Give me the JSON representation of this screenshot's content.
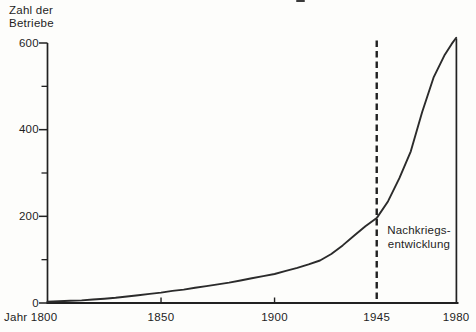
{
  "chart_data": {
    "type": "line",
    "title": "",
    "ylabel": "Zahl der Betriebe",
    "ylabel_lines": [
      "Zahl der",
      "Betriebe"
    ],
    "x_first_tick_label": "Jahr 1800",
    "xlim": [
      1800,
      1980
    ],
    "ylim": [
      0,
      600
    ],
    "grid": false,
    "legend": "none",
    "y_major_ticks": [
      0,
      200,
      400,
      600
    ],
    "y_minor_ticks": [
      100,
      300,
      500
    ],
    "x_ticks": [
      {
        "year": 1800,
        "label": "Jahr 1800",
        "corner": true,
        "tickmark": false
      },
      {
        "year": 1850,
        "label": "1850",
        "corner": false,
        "tickmark": true
      },
      {
        "year": 1900,
        "label": "1900",
        "corner": false,
        "tickmark": true
      },
      {
        "year": 1945,
        "label": "1945",
        "corner": false,
        "tickmark": false
      },
      {
        "year": 1980,
        "label": "1980",
        "corner": false,
        "tickmark": false
      }
    ],
    "annotation": {
      "lines": [
        "Nachkriegs-",
        "entwicklung"
      ],
      "year": 1945,
      "style": "dashed-vertical-line"
    },
    "right_border_year": 1980,
    "series": [
      {
        "name": "Zahl der Betriebe",
        "points": [
          [
            1800,
            3
          ],
          [
            1805,
            4
          ],
          [
            1810,
            5
          ],
          [
            1815,
            6
          ],
          [
            1820,
            8
          ],
          [
            1825,
            10
          ],
          [
            1830,
            12
          ],
          [
            1835,
            15
          ],
          [
            1840,
            18
          ],
          [
            1845,
            21
          ],
          [
            1850,
            24
          ],
          [
            1855,
            28
          ],
          [
            1860,
            31
          ],
          [
            1865,
            35
          ],
          [
            1870,
            39
          ],
          [
            1875,
            43
          ],
          [
            1880,
            47
          ],
          [
            1885,
            52
          ],
          [
            1890,
            57
          ],
          [
            1895,
            62
          ],
          [
            1900,
            67
          ],
          [
            1905,
            74
          ],
          [
            1910,
            81
          ],
          [
            1915,
            89
          ],
          [
            1920,
            98
          ],
          [
            1925,
            113
          ],
          [
            1930,
            133
          ],
          [
            1935,
            155
          ],
          [
            1940,
            177
          ],
          [
            1945,
            196
          ],
          [
            1950,
            235
          ],
          [
            1955,
            288
          ],
          [
            1960,
            350
          ],
          [
            1965,
            440
          ],
          [
            1970,
            520
          ],
          [
            1975,
            573
          ],
          [
            1978,
            598
          ],
          [
            1980,
            612
          ]
        ]
      }
    ],
    "ink_color": "#212121",
    "curve_color": "#2b2b2b",
    "background": "#fdfdfb"
  }
}
